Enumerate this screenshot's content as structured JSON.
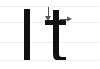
{
  "canvas": {
    "width": 100,
    "height": 69,
    "background": "#ffffff",
    "title": "Glyph metrics diagram"
  },
  "grid": {
    "color": "#d9d9d9",
    "style": "dotted",
    "orientation": "horizontal",
    "line_positions_y": [
      6,
      22,
      42,
      60
    ],
    "line_names": [
      "ascender-line",
      "x-height-line",
      "midline",
      "baseline"
    ]
  },
  "glyphs": [
    {
      "name": "glyph-capital-i",
      "character": "I",
      "color": "#111111",
      "x": 24,
      "y": 9,
      "width": 6,
      "height": 51
    },
    {
      "name": "glyph-lowercase-t",
      "character": "t",
      "color": "#111111",
      "stem_x": 53,
      "stem_top_y": 10,
      "stem_bottom_y": 60,
      "stem_width": 6,
      "crossbar_y": 20,
      "crossbar_x_start": 45,
      "crossbar_x_end": 66,
      "crossbar_height": 5
    }
  ],
  "annotations": [
    {
      "name": "arrow-down",
      "direction": "down",
      "color": "#555555",
      "from_x": 48,
      "from_y": 7,
      "to_x": 48,
      "to_y": 21,
      "label": ""
    },
    {
      "name": "arrow-right",
      "direction": "right",
      "color": "#555555",
      "from_x": 60,
      "from_y": 19,
      "to_x": 72,
      "to_y": 19,
      "label": ""
    }
  ],
  "colors": {
    "glyph": "#111111",
    "grid": "#d9d9d9",
    "annotation": "#555555",
    "background": "#ffffff"
  }
}
